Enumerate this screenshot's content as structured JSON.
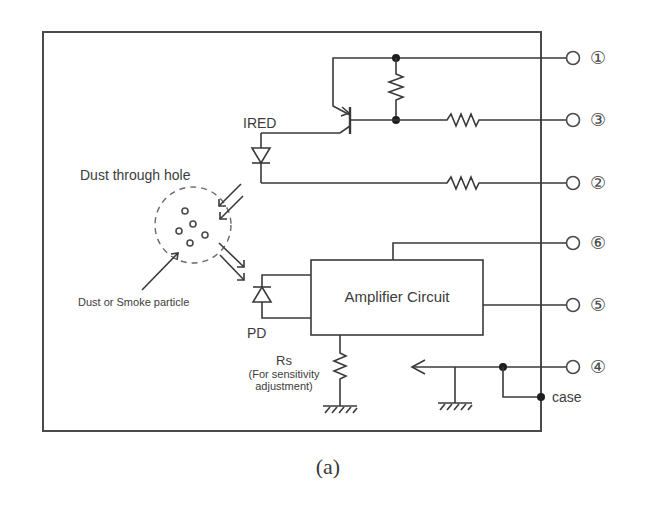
{
  "diagram": {
    "caption": "(a)",
    "labels": {
      "ired": "IRED",
      "dust_hole": "Dust through hole",
      "particle": "Dust or Smoke particle",
      "pd": "PD",
      "amplifier": "Amplifier Circuit",
      "rs": "Rs",
      "rs_note_line1": "(For sensitivity",
      "rs_note_line2": "adjustment)",
      "case": "case"
    },
    "pins": [
      {
        "id": "pin-1",
        "label": "①",
        "number": 1,
        "y": 58
      },
      {
        "id": "pin-3",
        "label": "③",
        "number": 3,
        "y": 120
      },
      {
        "id": "pin-2",
        "label": "②",
        "number": 2,
        "y": 183
      },
      {
        "id": "pin-6",
        "label": "⑥",
        "number": 6,
        "y": 243
      },
      {
        "id": "pin-5",
        "label": "⑤",
        "number": 5,
        "y": 305
      },
      {
        "id": "pin-4",
        "label": "④",
        "number": 4,
        "y": 367
      }
    ],
    "components": [
      {
        "type": "pnp-transistor",
        "name": "driver transistor"
      },
      {
        "type": "resistor",
        "name": "base-emitter resistor"
      },
      {
        "type": "resistor",
        "name": "pin 3 series resistor"
      },
      {
        "type": "resistor",
        "name": "pin 2 series resistor"
      },
      {
        "type": "ired-diode",
        "name": "IRED"
      },
      {
        "type": "photodiode",
        "name": "PD"
      },
      {
        "type": "block",
        "name": "Amplifier Circuit"
      },
      {
        "type": "resistor",
        "name": "Rs"
      },
      {
        "type": "ground",
        "name": "ground x2"
      }
    ],
    "colors": {
      "line": "#3a3a3a",
      "frame": "#4a4a4a",
      "text": "#3c3c3c",
      "background": "#ffffff"
    }
  }
}
